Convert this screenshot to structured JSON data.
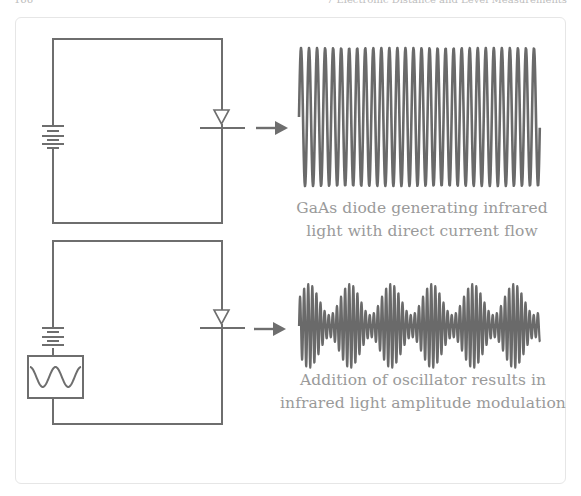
{
  "running_head": {
    "page_number": "166",
    "chapter_title": "7 Electronic Distance and Level Measurements"
  },
  "colors": {
    "wire": "#6e6e6e",
    "wave": "#6a6a6a",
    "caption": "#9a9a9a",
    "frame": "#e6e6e6"
  },
  "top_panel": {
    "circuit": {
      "components": [
        "battery-icon",
        "led-diode-icon",
        "emission-arrow-icon"
      ]
    },
    "waveform": {
      "type": "continuous",
      "cycles": 30,
      "x_start": 299,
      "x_end": 540,
      "center_y": 117,
      "amplitude": 69
    },
    "caption_line1": "GaAs diode generating infrared",
    "caption_line2": "light with direct current flow"
  },
  "bottom_panel": {
    "circuit": {
      "components": [
        "battery-icon",
        "oscillator-icon",
        "led-diode-icon",
        "emission-arrow-icon"
      ]
    },
    "waveform": {
      "type": "amplitude-modulated",
      "carrier_period": 4.1,
      "envelope_period": 41,
      "envelope_first_peak_x": 309,
      "x_start": 299,
      "x_end": 540,
      "center_y": 326,
      "max_amplitude": 42,
      "min_amplitude": 11
    },
    "caption_line1": "Addition of oscillator results in",
    "caption_line2": "infrared light amplitude modulation"
  }
}
